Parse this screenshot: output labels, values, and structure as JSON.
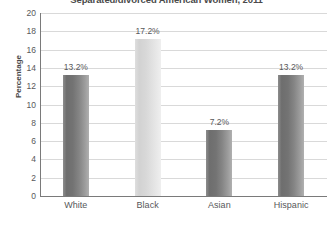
{
  "chart_data": {
    "type": "bar",
    "title": "Separated/divorced American Women, 2011",
    "xlabel": "",
    "ylabel": "Percentage",
    "ylim": [
      0,
      20
    ],
    "ytick_step": 2,
    "yticks": [
      "0",
      "2",
      "4",
      "6",
      "8",
      "10",
      "12",
      "14",
      "16",
      "18",
      "20"
    ],
    "grid": true,
    "legend": "none",
    "categories": [
      "White",
      "Black",
      "Asian",
      "Hispanic"
    ],
    "values": [
      13.2,
      17.2,
      7.2,
      13.2
    ],
    "data_labels": [
      "13.2%",
      "17.2%",
      "7.2%",
      "13.2%"
    ],
    "bar_styles": [
      "dark",
      "light",
      "dark",
      "dark"
    ],
    "colors": {
      "bar_dark": "#7a7a7a",
      "bar_light": "#dcdcdc",
      "gridline": "#d9d9d9",
      "axis": "#7a7a7a",
      "text": "#58585a",
      "title": "#4a4a4a",
      "background": "#ffffff"
    }
  }
}
